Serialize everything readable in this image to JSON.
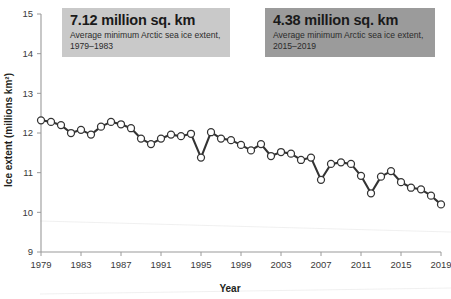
{
  "chart_data": {
    "type": "line",
    "title": "",
    "xlabel": "Year",
    "ylabel": "Ice extent (millions km²)",
    "xlim": [
      1979,
      2019
    ],
    "ylim": [
      9,
      15
    ],
    "grid": false,
    "legend": null,
    "marker": "open-circle",
    "line_color": "#333333",
    "marker_fill": "#ffffff",
    "x_ticks": [
      1979,
      1983,
      1987,
      1991,
      1995,
      1999,
      2003,
      2007,
      2011,
      2015,
      2019
    ],
    "y_ticks": [
      9,
      10,
      11,
      12,
      13,
      14,
      15
    ],
    "x": [
      1979,
      1980,
      1981,
      1982,
      1983,
      1984,
      1985,
      1986,
      1987,
      1988,
      1989,
      1990,
      1991,
      1992,
      1993,
      1994,
      1995,
      1996,
      1997,
      1998,
      1999,
      2000,
      2001,
      2002,
      2003,
      2004,
      2005,
      2006,
      2007,
      2008,
      2009,
      2010,
      2011,
      2012,
      2013,
      2014,
      2015,
      2016,
      2017,
      2018,
      2019
    ],
    "values": [
      12.32,
      12.28,
      12.2,
      12.0,
      12.08,
      11.96,
      12.16,
      12.28,
      12.22,
      12.12,
      11.86,
      11.72,
      11.86,
      11.96,
      11.92,
      11.98,
      11.38,
      12.02,
      11.86,
      11.82,
      11.7,
      11.56,
      11.72,
      11.42,
      11.52,
      11.48,
      11.32,
      11.38,
      10.82,
      11.22,
      11.26,
      11.22,
      10.92,
      10.48,
      10.9,
      11.04,
      10.76,
      10.62,
      10.58,
      10.42,
      10.2
    ],
    "series_name": "Arctic sea ice extent",
    "annotations": [
      {
        "id": "callout-1",
        "value": "7.12 million sq. km",
        "description": "Average minimum Arctic sea ice extent, 1979–1983",
        "background": "#c9c9c9"
      },
      {
        "id": "callout-2",
        "value": "4.38 million sq. km",
        "description": "Average minimum Arctic sea ice extent, 2015–2019",
        "background": "#9b9b9b"
      }
    ]
  },
  "axes": {
    "y_label": "Ice extent (millions km²)",
    "x_label": "Year",
    "y_tick_labels": [
      "15",
      "14",
      "13",
      "12",
      "11",
      "10",
      "9"
    ],
    "x_tick_labels": [
      "1979",
      "1983",
      "1987",
      "1991",
      "1995",
      "1999",
      "2003",
      "2007",
      "2011",
      "2015",
      "2019"
    ]
  },
  "callouts": {
    "first": {
      "value": "7.12 million sq. km",
      "desc": "Average minimum Arctic sea ice extent, 1979–1983"
    },
    "second": {
      "value": "4.38 million sq. km",
      "desc": "Average minimum Arctic sea ice extent, 2015–2019"
    }
  }
}
